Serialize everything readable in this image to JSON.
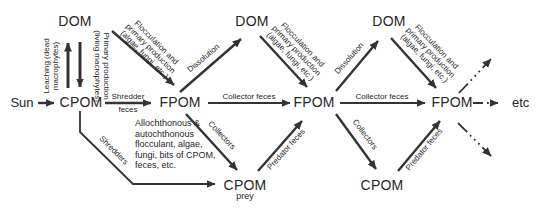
{
  "figure": {
    "colors": {
      "ink": "#333333",
      "text": "#262626",
      "background": "#ffffff"
    }
  },
  "nodes": {
    "sun": "Sun",
    "cpom1": "CPOM",
    "dom1": "DOM",
    "fpom1": "FPOM",
    "dom2": "DOM",
    "fpom2": "FPOM",
    "cpom_prey": "CPOM",
    "cpom_prey_sub": "prey",
    "dom3": "DOM",
    "fpom3": "FPOM",
    "cpom3": "CPOM",
    "etc": "etc"
  },
  "edges": {
    "leaching": [
      "Leaching (dead",
      "macrophytes)"
    ],
    "primary_production": [
      "Primary production",
      "(living macrophytes)"
    ],
    "flocculation": [
      "Flocculation and",
      "primary production",
      "(algae, fungi, etc.)"
    ],
    "shredder_feces": [
      "Shredder",
      "feces"
    ],
    "collector_feces": "Collector feces",
    "dissolution": "Dissolution",
    "collectors": "Collectors",
    "predator_feces": "Predator feces",
    "shredders": "Shredders"
  },
  "fpom_note": [
    "Allochthonous &",
    "autochthonous",
    "flocculant, algae,",
    "fungi, bits of CPOM,",
    "feces, etc."
  ]
}
